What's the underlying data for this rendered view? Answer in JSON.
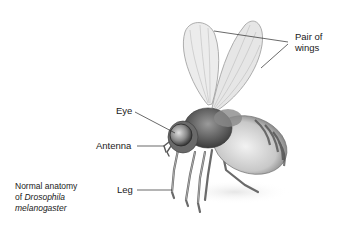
{
  "diagram": {
    "labels": {
      "wings": "Pair of wings",
      "wings_line1": "Pair of",
      "wings_line2": "wings",
      "eye": "Eye",
      "antenna": "Antenna",
      "leg": "Leg"
    },
    "caption": {
      "line1": "Normal anatomy",
      "line2_prefix": "of ",
      "line2_italic": "Drosophila",
      "line3_italic": "melanogaster"
    },
    "colors": {
      "background": "#ffffff",
      "text": "#1a1a1a",
      "leader_line": "#2a2a2a",
      "wing_fill": "#e9e9e9",
      "body_dark": "#5a5a5a",
      "body_light": "#d8d8d8"
    }
  }
}
